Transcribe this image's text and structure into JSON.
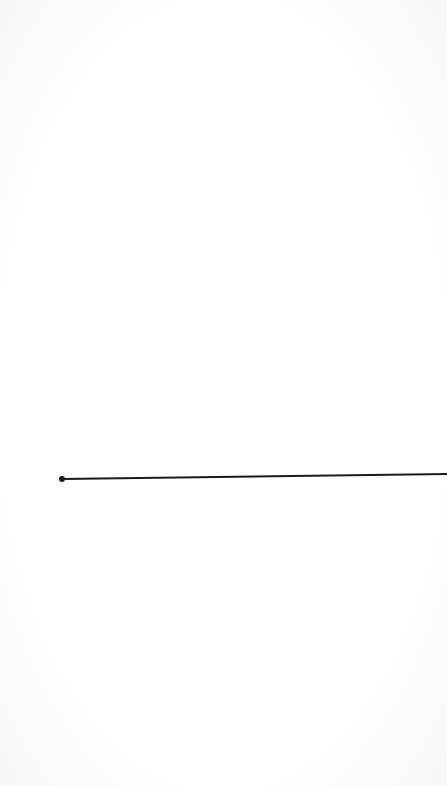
{
  "canvas": {
    "background": "#ffffff",
    "line": {
      "x1": 62,
      "y1": 479,
      "x2": 447,
      "y2": 474,
      "stroke": "#1a1a1a",
      "stroke_width": 2,
      "start_handle": {
        "cx": 62,
        "cy": 479,
        "r": 3
      }
    }
  }
}
